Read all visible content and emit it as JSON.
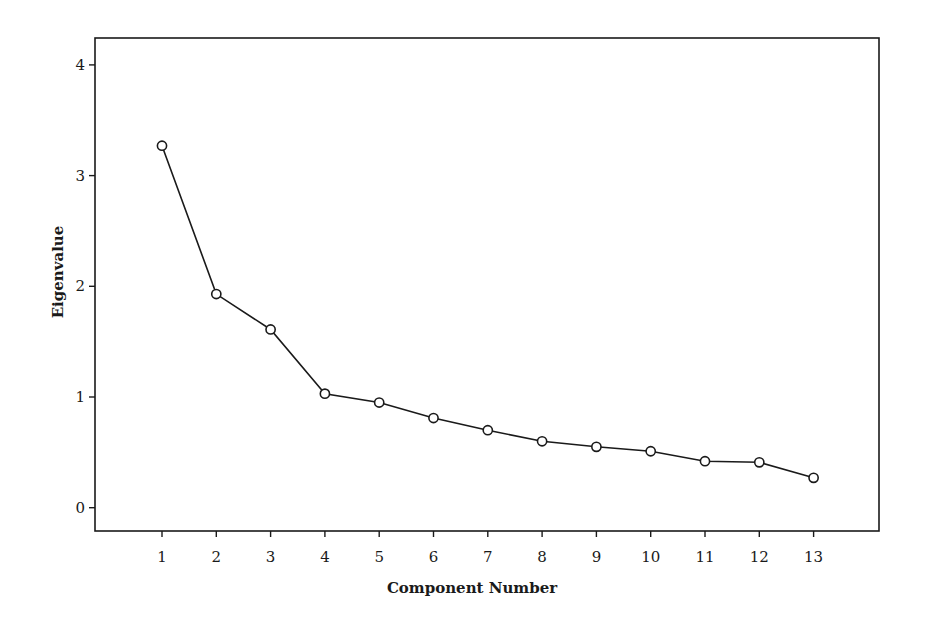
{
  "chart_data": {
    "type": "line",
    "title": "",
    "xlabel": "Component Number",
    "ylabel": "Eigenvalue",
    "categories": [
      "1",
      "2",
      "3",
      "4",
      "5",
      "6",
      "7",
      "8",
      "9",
      "10",
      "11",
      "12",
      "13"
    ],
    "x": [
      1,
      2,
      3,
      4,
      5,
      6,
      7,
      8,
      9,
      10,
      11,
      12,
      13
    ],
    "series": [
      {
        "name": "Eigenvalue",
        "values": [
          3.27,
          1.93,
          1.61,
          1.03,
          0.95,
          0.81,
          0.7,
          0.6,
          0.55,
          0.51,
          0.42,
          0.41,
          0.27
        ],
        "marker": "open-circle",
        "color": "#1a1a1a"
      }
    ],
    "yticks": [
      0,
      1,
      2,
      3,
      4
    ],
    "ytick_labels": [
      "0",
      "1",
      "2",
      "3",
      "4"
    ],
    "xticks": [
      1,
      2,
      3,
      4,
      5,
      6,
      7,
      8,
      9,
      10,
      11,
      12,
      13
    ],
    "xtick_labels": [
      "1",
      "2",
      "3",
      "4",
      "5",
      "6",
      "7",
      "8",
      "9",
      "10",
      "11",
      "12",
      "13"
    ],
    "ylim": [
      -0.21,
      4.23
    ],
    "xlim": [
      0.38,
      14.83
    ],
    "grid": false,
    "legend": null
  },
  "layout": {
    "frame": {
      "left": 95,
      "top": 38,
      "right": 879,
      "bottom": 531
    },
    "x_px_per_unit": 54.3,
    "x_origin_px": 162,
    "y_px_per_unit": 110.7,
    "y_origin_px": 507.7,
    "line_color": "#1a1a1a",
    "background": "#ffffff"
  }
}
